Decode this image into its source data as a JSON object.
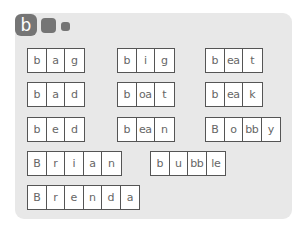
{
  "header": {
    "badge_letter": "b"
  },
  "words": [
    {
      "id": "bag",
      "segments": [
        "b",
        "a",
        "g"
      ]
    },
    {
      "id": "big",
      "segments": [
        "b",
        "i",
        "g"
      ]
    },
    {
      "id": "beat",
      "segments": [
        "b",
        "ea",
        "t"
      ]
    },
    {
      "id": "bad",
      "segments": [
        "b",
        "a",
        "d"
      ]
    },
    {
      "id": "boat",
      "segments": [
        "b",
        "oa",
        "t"
      ]
    },
    {
      "id": "beak",
      "segments": [
        "b",
        "ea",
        "k"
      ]
    },
    {
      "id": "bed",
      "segments": [
        "b",
        "e",
        "d"
      ]
    },
    {
      "id": "bean",
      "segments": [
        "b",
        "ea",
        "n"
      ]
    },
    {
      "id": "Bobby",
      "segments": [
        "B",
        "o",
        "bb",
        "y"
      ]
    },
    {
      "id": "Brian",
      "segments": [
        "B",
        "r",
        "i",
        "a",
        "n"
      ]
    },
    {
      "id": "bubble",
      "segments": [
        "b",
        "u",
        "bb",
        "le"
      ]
    },
    {
      "id": "Brenda",
      "segments": [
        "B",
        "r",
        "e",
        "n",
        "d",
        "a"
      ]
    }
  ],
  "colors": {
    "panel": "#e8e8e8",
    "badge": "#757575",
    "cell_border": "#555555",
    "cell_text": "#666666"
  }
}
